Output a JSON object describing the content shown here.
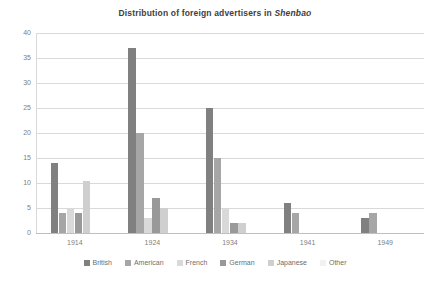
{
  "chart_data": {
    "type": "bar",
    "title": "Distribution of foreign advertisers in Shenbao",
    "title_plain": "Distribution of foreign advertisers in ",
    "title_italic": "Shenbao",
    "xlabel": "",
    "ylabel": "",
    "categories": [
      "1914",
      "1924",
      "1934",
      "1941",
      "1949"
    ],
    "ylim": [
      0,
      40
    ],
    "yticks": [
      0,
      5,
      10,
      15,
      20,
      25,
      30,
      35,
      40
    ],
    "ytick_labels": [
      "0",
      "5",
      "10",
      "15",
      "20",
      "25",
      "30",
      "35",
      "40"
    ],
    "grid": true,
    "grid_axis": "y",
    "legend_position": "bottom",
    "series": [
      {
        "name": "British",
        "color": "#808080",
        "values": [
          14,
          37,
          25,
          6,
          3
        ]
      },
      {
        "name": "American",
        "color": "#a6a6a6",
        "values": [
          4,
          20,
          15,
          4,
          4
        ]
      },
      {
        "name": "French",
        "color": "#d9d9d9",
        "values": [
          5,
          3,
          5,
          0,
          0
        ]
      },
      {
        "name": "German",
        "color": "#999999",
        "values": [
          4,
          7,
          2,
          0,
          0
        ]
      },
      {
        "name": "Japanese",
        "color": "#cfcfcf",
        "values": [
          10.5,
          5,
          2,
          0,
          0
        ]
      },
      {
        "name": "Other",
        "color": "#f2f2f2",
        "values": [
          0,
          0,
          0,
          0,
          0
        ]
      }
    ]
  }
}
